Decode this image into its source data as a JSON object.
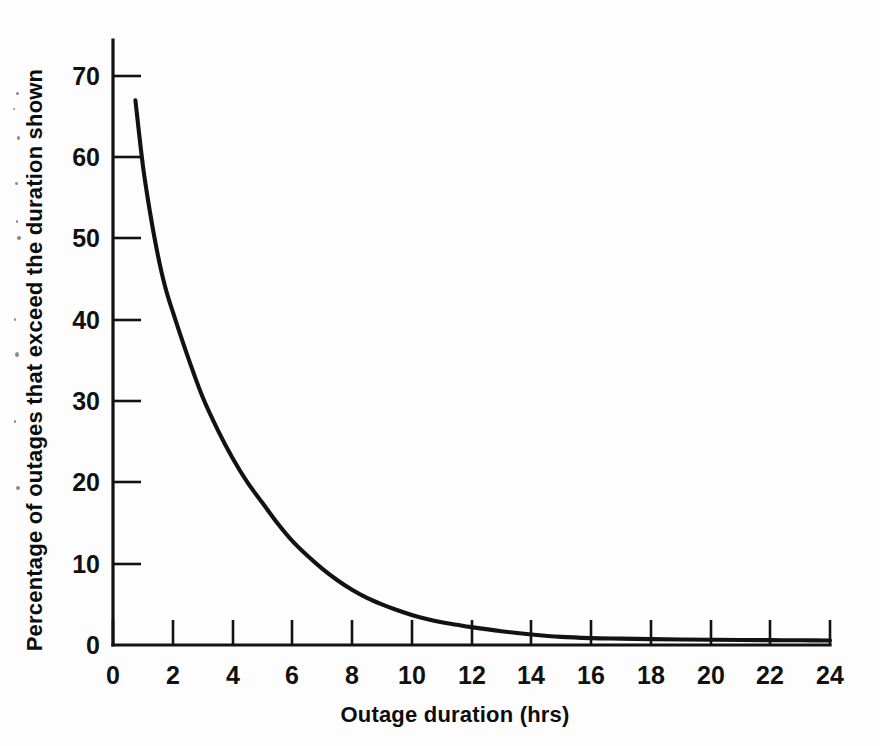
{
  "chart_data": {
    "type": "line",
    "title": "",
    "subtitle": "",
    "xlabel": "Outage duration (hrs)",
    "ylabel": "Percentage of outages that exceed the duration shown",
    "xlim": [
      0,
      24
    ],
    "ylim": [
      0,
      75
    ],
    "xticks": [
      0,
      2,
      4,
      6,
      8,
      10,
      12,
      14,
      16,
      18,
      20,
      22,
      24
    ],
    "xtick_labels": [
      "0",
      "2",
      "4",
      "6",
      "8",
      "10",
      "12",
      "14",
      "16",
      "18",
      "20",
      "22",
      "24"
    ],
    "yticks": [
      0,
      10,
      20,
      30,
      40,
      50,
      60,
      70
    ],
    "ytick_labels": [
      "0",
      "10",
      "20",
      "30",
      "40",
      "50",
      "60",
      "70"
    ],
    "grid": false,
    "legend": false,
    "legend_position": "none",
    "line_color": "#121212",
    "background_color": "#fdfdfd",
    "series": [
      {
        "name": "Percentage of outages exceeding duration",
        "x": [
          0.75,
          1.0,
          1.25,
          1.5,
          1.75,
          2.0,
          2.5,
          3.0,
          3.5,
          4.0,
          4.5,
          5.0,
          5.5,
          6.0,
          6.5,
          7.0,
          7.5,
          8.0,
          8.5,
          9.0,
          9.5,
          10.0,
          10.5,
          11.0,
          11.5,
          12.0,
          13.0,
          14.0,
          15.0,
          16.0,
          17.0,
          18.0,
          19.0,
          20.0,
          21.0,
          22.0,
          23.0,
          24.0
        ],
        "y": [
          67.0,
          59.0,
          53.0,
          48.0,
          44.0,
          41.0,
          35.5,
          30.5,
          26.5,
          23.0,
          20.0,
          17.5,
          15.0,
          12.8,
          11.0,
          9.4,
          8.0,
          6.8,
          5.8,
          5.0,
          4.3,
          3.7,
          3.2,
          2.8,
          2.5,
          2.2,
          1.7,
          1.3,
          1.0,
          0.85,
          0.78,
          0.72,
          0.68,
          0.65,
          0.62,
          0.6,
          0.58,
          0.55
        ]
      }
    ],
    "readings": {
      "at_1_hr": 59,
      "at_2_hrs": 41,
      "at_4_hrs": 23,
      "at_6_hrs": 12.8,
      "at_8_hrs": 6.8,
      "at_10_hrs": 3.7,
      "at_12_hrs": 2.2,
      "at_14_hrs": 1.3,
      "at_16_hrs": 0.85,
      "at_24_hrs": 0.55
    }
  }
}
